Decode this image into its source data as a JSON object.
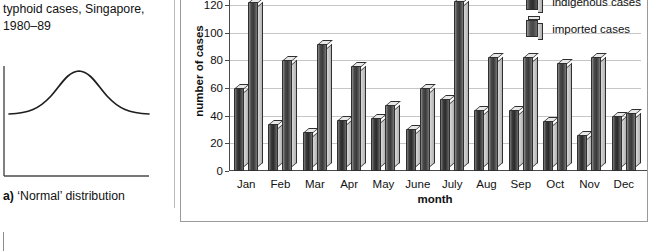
{
  "left_panel": {
    "caption_top": "typhoid cases, Singapore, 1980–89",
    "caption_prefix": "a)",
    "caption_bottom": " ‘Normal’ distribution",
    "curve_name": "normal-distribution-curve"
  },
  "chart_data": {
    "type": "bar",
    "title": "",
    "xlabel": "month",
    "ylabel": "number of cases",
    "categories": [
      "Jan",
      "Feb",
      "Mar",
      "Apr",
      "May",
      "June",
      "July",
      "Aug",
      "Sep",
      "Oct",
      "Nov",
      "Dec"
    ],
    "series": [
      {
        "name": "indigenous cases",
        "values": [
          60,
          34,
          28,
          37,
          38,
          30,
          52,
          44,
          44,
          36,
          26,
          40
        ]
      },
      {
        "name": "imported cases",
        "values": [
          122,
          80,
          92,
          76,
          48,
          60,
          123,
          82,
          82,
          78,
          82,
          42
        ]
      }
    ],
    "ylim": [
      0,
      130
    ],
    "yticks": [
      0,
      20,
      40,
      60,
      80,
      100,
      120
    ],
    "grid": true,
    "legend_position": "top-right"
  }
}
